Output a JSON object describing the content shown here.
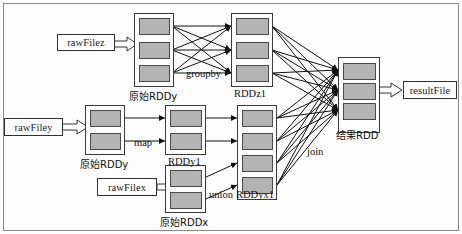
{
  "diagram": {
    "colors": {
      "partition_fill": "#b3b3b3",
      "partition_stroke": "#4a4a4a",
      "group_stroke": "#3a3a3a",
      "edge_stroke": "#1a1a1a",
      "frame_stroke": "#8a8a8a",
      "background": "#ffffff"
    },
    "files": [
      {
        "id": "rawFilez",
        "label": "rawFilez"
      },
      {
        "id": "rawFiley",
        "label": "rawFiley"
      },
      {
        "id": "rawFilex",
        "label": "rawFilex"
      },
      {
        "id": "resultFile",
        "label": "resultFile"
      }
    ],
    "rdds": [
      {
        "id": "origRDDy_top",
        "label": "原始RDDy",
        "partitions": 3
      },
      {
        "id": "RDDz1",
        "label": "RDDz1",
        "partitions": 3
      },
      {
        "id": "origRDDy",
        "label": "原始RDDy",
        "partitions": 2
      },
      {
        "id": "RDDy1",
        "label": "RDDy1",
        "partitions": 2
      },
      {
        "id": "origRDDx",
        "label": "原始RDDx",
        "partitions": 2
      },
      {
        "id": "RDDyx1",
        "label": "RDDyx1",
        "partitions": 4
      },
      {
        "id": "resultRDD",
        "label": "结果RDD",
        "partitions": 3
      }
    ],
    "operations": [
      {
        "id": "groupby",
        "label": "groupby"
      },
      {
        "id": "map",
        "label": "map"
      },
      {
        "id": "union",
        "label": "union"
      },
      {
        "id": "join",
        "label": "join"
      }
    ]
  }
}
